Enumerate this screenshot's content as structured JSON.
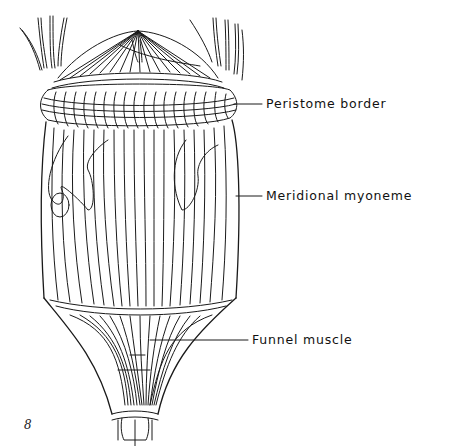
{
  "diagram": {
    "style": "black ink line drawing on white",
    "colors": {
      "ink": "#1a1a1a",
      "background": "#ffffff"
    },
    "labels": [
      {
        "id": "peristome",
        "text": "Peristome border"
      },
      {
        "id": "myoneme",
        "text": "Meridional myoneme"
      },
      {
        "id": "funnel",
        "text": "Funnel muscle"
      }
    ],
    "figure_mark": "8"
  }
}
